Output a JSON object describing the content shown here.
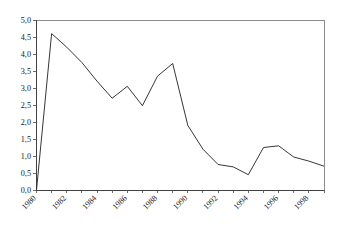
{
  "chart_data": {
    "type": "line",
    "title": "",
    "subtitle": "",
    "xlabel": "",
    "ylabel": "",
    "x": [
      1980,
      1981,
      1982,
      1983,
      1984,
      1985,
      1986,
      1987,
      1988,
      1989,
      1990,
      1991,
      1992,
      1993,
      1994,
      1995,
      1996,
      1997,
      1998,
      1999
    ],
    "values": [
      0.0,
      4.6,
      4.2,
      3.75,
      3.2,
      2.7,
      3.05,
      2.48,
      3.35,
      3.72,
      1.9,
      1.2,
      0.75,
      0.68,
      0.45,
      1.25,
      1.3,
      0.97,
      0.85,
      0.7
    ],
    "series": [
      {
        "name": "series-1",
        "values": [
          0.0,
          4.6,
          4.2,
          3.75,
          3.2,
          2.7,
          3.05,
          2.48,
          3.35,
          3.72,
          1.9,
          1.2,
          0.75,
          0.68,
          0.45,
          1.25,
          1.3,
          0.97,
          0.85,
          0.7
        ]
      }
    ],
    "ylim": [
      0.0,
      5.0
    ],
    "xlim": [
      1980,
      1999
    ],
    "ytick_labels": [
      "0,0",
      "0,5",
      "1,0",
      "1,5",
      "2,0",
      "2,5",
      "3,0",
      "3,5",
      "4,0",
      "4,5",
      "5,0"
    ],
    "ytick_values": [
      0.0,
      0.5,
      1.0,
      1.5,
      2.0,
      2.5,
      3.0,
      3.5,
      4.0,
      4.5,
      5.0
    ],
    "xtick_labels": [
      "1980",
      "1982",
      "1984",
      "1986",
      "1988",
      "1990",
      "1992",
      "1994",
      "1996",
      "1998"
    ],
    "xtick_values": [
      1980,
      1982,
      1984,
      1986,
      1988,
      1990,
      1992,
      1994,
      1996,
      1998
    ],
    "xtick_all_values": [
      1980,
      1981,
      1982,
      1983,
      1984,
      1985,
      1986,
      1987,
      1988,
      1989,
      1990,
      1991,
      1992,
      1993,
      1994,
      1995,
      1996,
      1997,
      1998,
      1999
    ],
    "xtick_label_rotation": -45,
    "grid": false,
    "legend": false,
    "legend_position": "none",
    "line_color": "#2b2b2b",
    "frame_color": "#6e6e6e",
    "axis_color": "#3a3a3a",
    "background_color": "#ffffff",
    "markers": false
  }
}
